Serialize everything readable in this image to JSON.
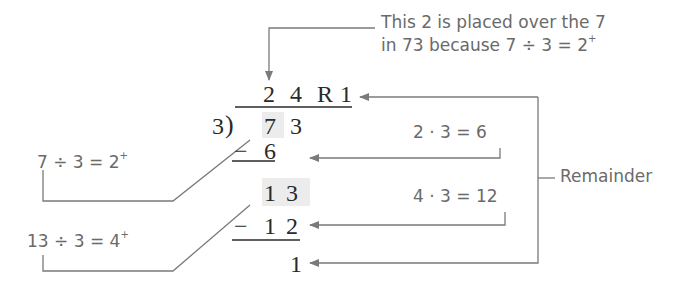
{
  "diagram": {
    "divisor": "3",
    "dividend_digits": [
      "7",
      "3"
    ],
    "quotient": {
      "digits": [
        "2",
        "4"
      ],
      "r_label": "R",
      "remainder": "1"
    },
    "steps": [
      {
        "sign": "−",
        "value": "6"
      },
      {
        "bring_down": "1 3"
      },
      {
        "sign": "−",
        "value": "1 2"
      },
      {
        "final_remainder": "1"
      }
    ]
  },
  "annotations": {
    "top_note_line1": "This 2 is placed over the 7",
    "top_note_line2": "in 73 because 7 ÷ 3 = 2",
    "top_note_sup": "+",
    "left_note_1": "7 ÷ 3 = 2",
    "left_note_1_sup": "+",
    "left_note_2": "13 ÷ 3 = 4",
    "left_note_2_sup": "+",
    "right_note_1": "2 · 3 = 6",
    "right_note_2": "4 · 3 = 12",
    "remainder_label": "Remainder"
  },
  "colors": {
    "text_serif": "#2a2a2a",
    "text_annotation": "#6a6a6a",
    "lines": "#7a7a7a",
    "highlight": "#ececec"
  }
}
